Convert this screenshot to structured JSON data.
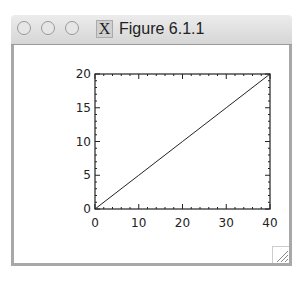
{
  "window": {
    "title": "Figure 6.1.1",
    "app_icon": "x11-icon",
    "app_icon_glyph": "X",
    "buttons": [
      "close-button",
      "minimize-button",
      "zoom-button"
    ]
  },
  "chart_data": {
    "type": "line",
    "title": "",
    "xlabel": "",
    "ylabel": "",
    "xlim": [
      0,
      40
    ],
    "ylim": [
      0,
      20
    ],
    "x_ticks": [
      "0",
      "10",
      "20",
      "30",
      "40"
    ],
    "y_ticks": [
      "0",
      "5",
      "10",
      "15",
      "20"
    ],
    "grid": false,
    "legend": null,
    "series": [
      {
        "name": "line",
        "x": [
          0,
          10,
          20,
          30,
          40
        ],
        "y": [
          0,
          5,
          10,
          15,
          20
        ]
      }
    ]
  }
}
